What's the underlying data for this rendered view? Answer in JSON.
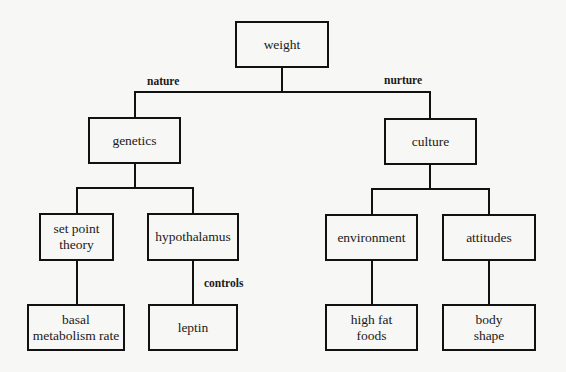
{
  "diagram": {
    "type": "tree",
    "root": {
      "label": "weight"
    },
    "branches": {
      "nature": {
        "edge_label": "nature",
        "node": "genetics",
        "children": [
          {
            "label": "set point\ntheory",
            "child": {
              "label": "basal\nmetabolism rate"
            }
          },
          {
            "label": "hypothalamus",
            "edge_label_below": "controls",
            "child": {
              "label": "leptin"
            }
          }
        ]
      },
      "nurture": {
        "edge_label": "nurture",
        "node": "culture",
        "children": [
          {
            "label": "environment",
            "child": {
              "label": "high fat\nfoods"
            }
          },
          {
            "label": "attitudes",
            "child": {
              "label": "body\nshape"
            }
          }
        ]
      }
    }
  },
  "nodes": {
    "weight": "weight",
    "genetics": "genetics",
    "culture": "culture",
    "set_point_theory": "set point\ntheory",
    "hypothalamus": "hypothalamus",
    "environment": "environment",
    "attitudes": "attitudes",
    "basal_metabolism_rate": "basal\nmetabolism rate",
    "leptin": "leptin",
    "high_fat_foods": "high fat\nfoods",
    "body_shape": "body\nshape"
  },
  "edge_labels": {
    "nature": "nature",
    "nurture": "nurture",
    "controls": "controls"
  }
}
